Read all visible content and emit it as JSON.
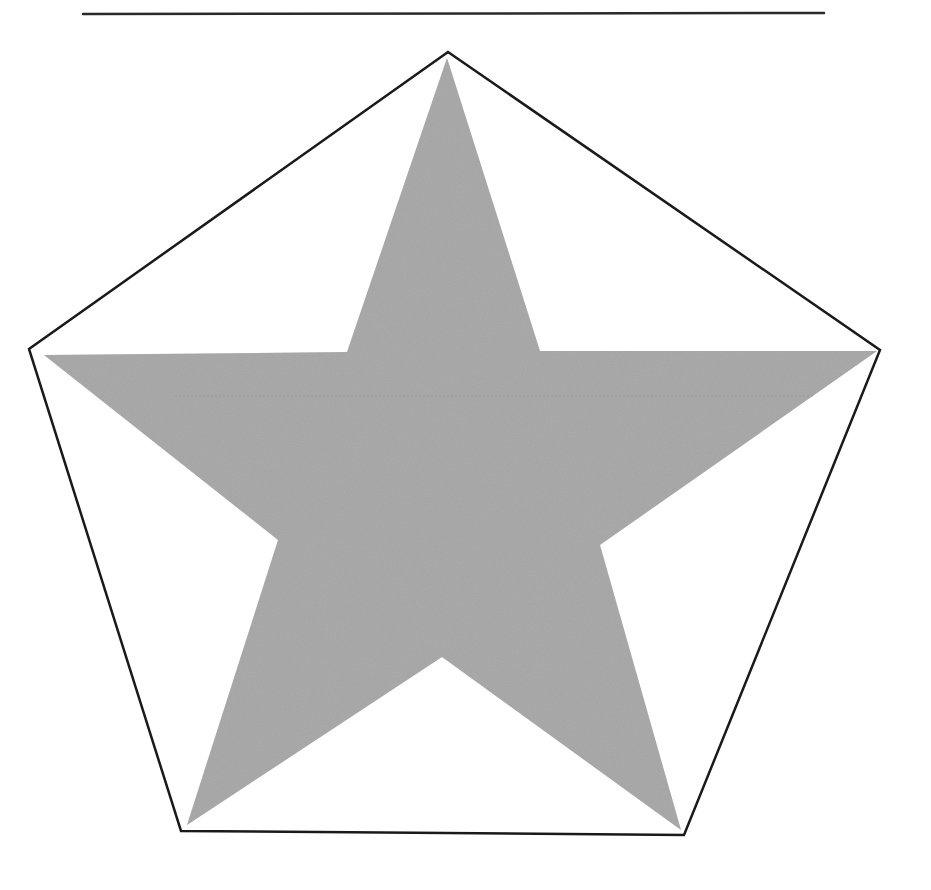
{
  "figure": {
    "header_rule": {
      "x1": 83,
      "y1": 14,
      "x2": 824,
      "y2": 13,
      "color": "#2a2a2a",
      "width": 2.5
    },
    "pentagon": {
      "points": [
        [
          448,
          52
        ],
        [
          880,
          350
        ],
        [
          684,
          835
        ],
        [
          181,
          831
        ],
        [
          29,
          349
        ]
      ],
      "stroke": "#1a1a1a",
      "stroke_width": 2.5,
      "fill": "none"
    },
    "star": {
      "points": [
        [
          447,
          58
        ],
        [
          540,
          351
        ],
        [
          877,
          351
        ],
        [
          600,
          545
        ],
        [
          681,
          830
        ],
        [
          442,
          657
        ],
        [
          187,
          825
        ],
        [
          278,
          540
        ],
        [
          44,
          355
        ],
        [
          347,
          352
        ]
      ],
      "fill": "#a3a3a3",
      "texture": "stippled halftone"
    },
    "artifact_line": {
      "y": 396,
      "x1": 175,
      "x2": 815,
      "color": "#8f8f8f"
    }
  }
}
